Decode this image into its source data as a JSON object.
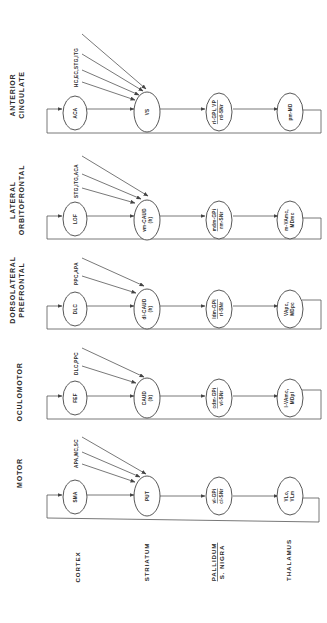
{
  "diagram": {
    "type": "basal-ganglia-thalamocortical-circuits",
    "orientation": "rotated-90-ccw",
    "columns": {
      "cortex": "CORTEX",
      "striatum": "STRIATUM",
      "pallidum": "PALLIDUM",
      "s_nigra": "S. NIGRA",
      "thalamus": "THALAMUS"
    },
    "loops": [
      {
        "title_lines": [
          "ANTERIOR",
          "CINGULATE"
        ],
        "inputs": "HC,EC,STG,ITG",
        "cortex": [
          "ACA"
        ],
        "striatum": [
          "VS"
        ],
        "pallidum_top": "rl-GPi, VP",
        "pallidum_bottom": "rd-SNr",
        "thalamus": [
          "pm-MD"
        ]
      },
      {
        "title_lines": [
          "LATERAL",
          "ORBITOFRONTAL"
        ],
        "inputs": "STG,ITG,ACA",
        "cortex": [
          "LOF"
        ],
        "striatum": [
          "vm-CAUD",
          "(h)"
        ],
        "pallidum_top": "mdm-GPi",
        "pallidum_bottom": "rm-SNr",
        "thalamus": [
          "m-VAmc,",
          "MDmc"
        ]
      },
      {
        "title_lines": [
          "DORSOLATERAL",
          "PREFRONTAL"
        ],
        "inputs": "PPC,APA",
        "cortex": [
          "DLC"
        ],
        "striatum": [
          "dl-CAUD",
          "(h)"
        ],
        "pallidum_top": "ldm-GPi",
        "pallidum_bottom": "rl-SNr",
        "thalamus": [
          "VApc,",
          "MDpc"
        ]
      },
      {
        "title_lines": [
          "OCULOMOTOR"
        ],
        "inputs": "DLC,PPC",
        "cortex": [
          "FEF"
        ],
        "striatum": [
          "CAUD",
          "(b)"
        ],
        "pallidum_top": "cdm-GPi",
        "pallidum_bottom": "vl-SNr",
        "thalamus": [
          "l-VAmc,",
          "MDpl"
        ]
      },
      {
        "title_lines": [
          "MOTOR"
        ],
        "inputs": "APA,MC,SC",
        "cortex": [
          "SMA"
        ],
        "striatum": [
          "PUT"
        ],
        "pallidum_top": "vl-GPi",
        "pallidum_bottom": "cl-SNr",
        "thalamus": [
          "VLo,",
          "VLm"
        ]
      }
    ]
  }
}
